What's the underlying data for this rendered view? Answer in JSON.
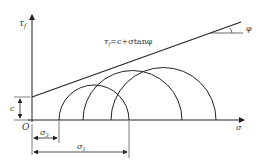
{
  "diagram": {
    "type": "Mohr-Coulomb failure envelope with Mohr circles",
    "axes": {
      "y_label": "τ",
      "y_label_sub": "f",
      "x_label": "σ",
      "origin_label": "O"
    },
    "equation": {
      "text": "τ",
      "sub": "f",
      "rest": "=c+σtanφ"
    },
    "angle_label": "φ",
    "cohesion_label": "c",
    "sigma3_label": "σ",
    "sigma3_sub": "3",
    "sigma1_label": "σ",
    "sigma1_sub": "1",
    "circles": [
      {
        "name": "circle-1",
        "left": 59,
        "right": 129
      },
      {
        "name": "circle-2",
        "left": 83,
        "right": 182
      },
      {
        "name": "circle-3",
        "left": 111,
        "right": 216
      }
    ],
    "colors": {
      "line": "#222222",
      "text": "#333333"
    }
  }
}
